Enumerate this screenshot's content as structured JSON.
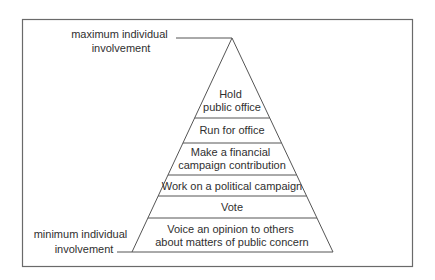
{
  "diagram": {
    "type": "pyramid",
    "top_label": [
      "maximum individual",
      "involvement"
    ],
    "bottom_label": [
      "minimum individual",
      "involvement"
    ],
    "levels_top_to_bottom": [
      {
        "lines": [
          "Hold",
          "public office"
        ]
      },
      {
        "lines": [
          "Run for office"
        ]
      },
      {
        "lines": [
          "Make a financial",
          "campaign contribution"
        ]
      },
      {
        "lines": [
          "Work on a political campaign"
        ]
      },
      {
        "lines": [
          "Vote"
        ]
      },
      {
        "lines": [
          "Voice an opinion to others",
          "about matters of public concern"
        ]
      }
    ]
  },
  "colors": {
    "line": "#555555",
    "text": "#2f2f2f",
    "frame": "#6a6a6a"
  }
}
